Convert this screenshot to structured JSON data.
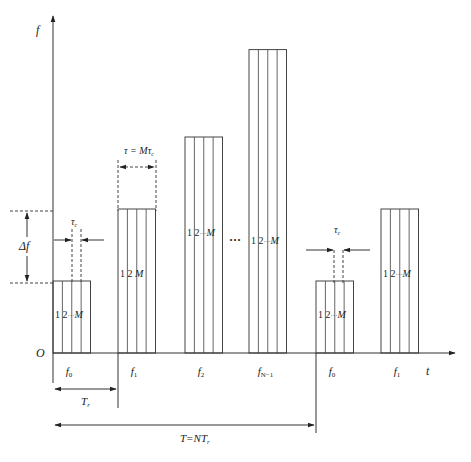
{
  "diagram": {
    "type": "frequency-hopping time-frequency pattern",
    "axes": {
      "y_label": "f",
      "x_label": "t",
      "origin_label": "O"
    },
    "subcarrier_label": {
      "one": "1",
      "two": "2",
      "dots": "···",
      "last": "M"
    },
    "ellipsis": "···",
    "hops": [
      {
        "label_main": "f",
        "label_sub": "0",
        "relative_level": 1,
        "show_index_labels": true
      },
      {
        "label_main": "f",
        "label_sub": "1",
        "relative_level": 2,
        "show_index_labels": true
      },
      {
        "label_main": "f",
        "label_sub": "2",
        "relative_level": 3,
        "show_index_labels": true
      },
      {
        "label_main": "f",
        "label_sub": "N−1",
        "relative_level": 4.3,
        "show_index_labels": true
      },
      {
        "label_main": "f",
        "label_sub": "0",
        "relative_level": 1,
        "show_index_labels": true
      },
      {
        "label_main": "f",
        "label_sub": "1",
        "relative_level": 2,
        "show_index_labels": true
      }
    ],
    "annotations": {
      "delta_f": "Δf",
      "tau_c": "τ",
      "tau_c_sub": "c",
      "tau_eq": "τ = Mτ",
      "tau_eq_sub": "c",
      "Tr": "T",
      "Tr_sub": "r",
      "T_total": "T=NT",
      "T_total_sub": "r"
    }
  }
}
